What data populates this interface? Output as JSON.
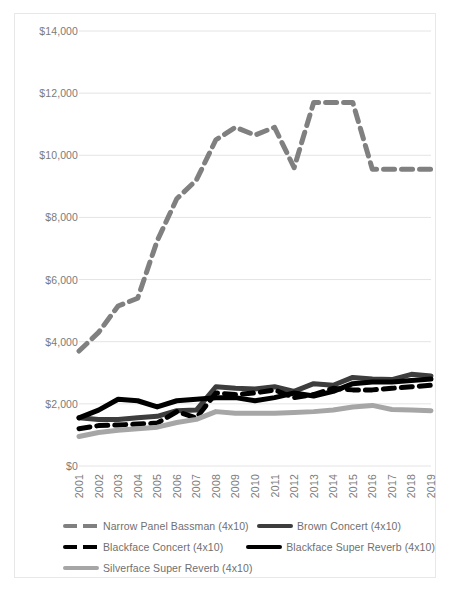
{
  "chart_data": {
    "type": "line",
    "title": "",
    "xlabel": "",
    "ylabel": "",
    "grid": true,
    "legend_position": "bottom",
    "ylim": [
      0,
      14000
    ],
    "yticks": [
      "$0",
      "$2,000",
      "$4,000",
      "$6,000",
      "$8,000",
      "$10,000",
      "$12,000",
      "$14,000"
    ],
    "ytick_values": [
      0,
      2000,
      4000,
      6000,
      8000,
      10000,
      12000,
      14000
    ],
    "categories": [
      "2001",
      "2002",
      "2003",
      "2004",
      "2005",
      "2006",
      "2007",
      "2008",
      "2009",
      "2010",
      "2011",
      "2012",
      "2013",
      "2014",
      "2015",
      "2016",
      "2017",
      "2018",
      "2019"
    ],
    "series": [
      {
        "name": "Narrow Panel Bassman (4x10)",
        "color": "#808080",
        "style": "dashed",
        "width": 5,
        "values": [
          3700,
          4300,
          5150,
          5400,
          7250,
          8600,
          9200,
          10500,
          10900,
          10650,
          10900,
          9600,
          11700,
          11700,
          11700,
          9550,
          9550,
          9550,
          9550
        ]
      },
      {
        "name": "Brown Concert (4x10)",
        "color": "#3d3d3d",
        "style": "solid",
        "width": 5,
        "values": [
          1550,
          1500,
          1500,
          1550,
          1600,
          1780,
          1800,
          2550,
          2500,
          2480,
          2550,
          2400,
          2650,
          2600,
          2850,
          2800,
          2780,
          2950,
          2900
        ]
      },
      {
        "name": "Blackface Concert (4x10)",
        "color": "#000000",
        "style": "dashed",
        "width": 5,
        "values": [
          1200,
          1300,
          1320,
          1350,
          1380,
          1750,
          1550,
          2350,
          2300,
          2350,
          2450,
          2200,
          2300,
          2500,
          2450,
          2450,
          2500,
          2550,
          2600
        ]
      },
      {
        "name": "Blackface Super Reverb (4x10)",
        "color": "#000000",
        "style": "solid",
        "width": 5,
        "values": [
          1550,
          1800,
          2150,
          2100,
          1900,
          2100,
          2150,
          2200,
          2200,
          2100,
          2200,
          2350,
          2250,
          2400,
          2650,
          2700,
          2700,
          2750,
          2800
        ]
      },
      {
        "name": "Silverface Super Reverb (4x10)",
        "color": "#a6a6a6",
        "style": "solid",
        "width": 5,
        "values": [
          950,
          1080,
          1150,
          1200,
          1250,
          1400,
          1500,
          1750,
          1700,
          1700,
          1700,
          1720,
          1750,
          1800,
          1900,
          1950,
          1820,
          1800,
          1780
        ]
      }
    ]
  },
  "legend": {
    "rows": [
      [
        {
          "label": "Narrow Panel Bassman (4x10)",
          "color": "#808080",
          "style": "dashed"
        },
        {
          "label": "Brown Concert (4x10)",
          "color": "#3d3d3d",
          "style": "solid"
        }
      ],
      [
        {
          "label": "Blackface Concert (4x10)",
          "color": "#000000",
          "style": "dashed"
        },
        {
          "label": "Blackface Super Reverb (4x10)",
          "color": "#000000",
          "style": "solid"
        }
      ],
      [
        {
          "label": "Silverface Super Reverb (4x10)",
          "color": "#a6a6a6",
          "style": "solid"
        }
      ]
    ]
  },
  "axis": {
    "gridline_color": "#e4e4e4",
    "tick_color": "#7b7b7b"
  }
}
